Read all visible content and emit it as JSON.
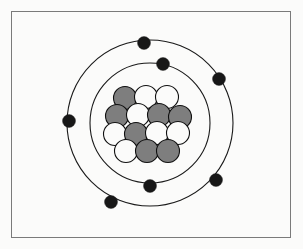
{
  "figure": {
    "name": "bohr-atomic-model",
    "frame": {
      "x": 11,
      "y": 11,
      "width": 280,
      "height": 227,
      "border_color": "#7a7a7a"
    },
    "background_color": "#fbfbfa"
  },
  "atom": {
    "center": {
      "x": 150,
      "y": 123
    },
    "nucleus": {
      "proton_color": "#7e7e7e",
      "neutron_color": "#fbfbfa",
      "outline_color": "#101010",
      "radius": 11.5,
      "proton_count": 7,
      "neutron_count": 7,
      "total_nucleons": 14,
      "particles": [
        {
          "id": "n1",
          "type": "proton",
          "x": 125,
          "y": 98
        },
        {
          "id": "n2",
          "type": "neutron",
          "x": 146,
          "y": 97
        },
        {
          "id": "n3",
          "type": "neutron",
          "x": 167,
          "y": 97
        },
        {
          "id": "n4",
          "type": "proton",
          "x": 117,
          "y": 116
        },
        {
          "id": "n5",
          "type": "neutron",
          "x": 138,
          "y": 115
        },
        {
          "id": "n6",
          "type": "proton",
          "x": 159,
          "y": 115
        },
        {
          "id": "n7",
          "type": "proton",
          "x": 180,
          "y": 117
        },
        {
          "id": "n8",
          "type": "neutron",
          "x": 115,
          "y": 134
        },
        {
          "id": "n9",
          "type": "proton",
          "x": 136,
          "y": 134
        },
        {
          "id": "n10",
          "type": "neutron",
          "x": 157,
          "y": 133
        },
        {
          "id": "n11",
          "type": "neutron",
          "x": 178,
          "y": 133
        },
        {
          "id": "n12",
          "type": "neutron",
          "x": 126,
          "y": 151
        },
        {
          "id": "n13",
          "type": "proton",
          "x": 147,
          "y": 151
        },
        {
          "id": "n14",
          "type": "proton",
          "x": 168,
          "y": 151
        }
      ]
    },
    "shells": [
      {
        "id": "shell-inner",
        "label": "K",
        "radius": 60,
        "stroke_color": "#1a1a1a",
        "electron_count": 2,
        "electrons": [
          {
            "id": "e-inner-1",
            "x": 163,
            "y": 64
          },
          {
            "id": "e-inner-2",
            "x": 150,
            "y": 186
          }
        ]
      },
      {
        "id": "shell-outer",
        "label": "L",
        "radius": 83,
        "stroke_color": "#1a1a1a",
        "electron_count": 5,
        "electrons": [
          {
            "id": "e-outer-1",
            "x": 144,
            "y": 43
          },
          {
            "id": "e-outer-2",
            "x": 219,
            "y": 79
          },
          {
            "id": "e-outer-3",
            "x": 216,
            "y": 180
          },
          {
            "id": "e-outer-4",
            "x": 111,
            "y": 202
          },
          {
            "id": "e-outer-5",
            "x": 69,
            "y": 121
          }
        ]
      }
    ],
    "electron_color": "#171717",
    "electron_radius": 6.5,
    "total_electrons": 7
  }
}
